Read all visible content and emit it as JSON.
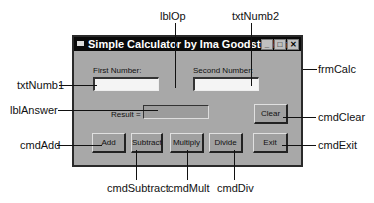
{
  "form": {
    "title": "Simple Calculator by Ima Goodstudent",
    "window_buttons": [
      "_",
      "□",
      "✕"
    ],
    "first_label": "First Number:",
    "second_label": "Second Number:",
    "result_label": "Result =",
    "txtNumb1_value": "",
    "txtNumb2_value": "",
    "buttons": {
      "add": "Add",
      "subtract": "Subtract",
      "multiply": "Multiply",
      "divide": "Divide",
      "clear": "Clear",
      "exit": "Exit"
    }
  },
  "callouts": {
    "lblOp": "lblOp",
    "txtNumb2": "txtNumb2",
    "frmCalc": "frmCalc",
    "txtNumb1": "txtNumb1",
    "lblAnswer": "lblAnswer",
    "cmdClear": "cmdClear",
    "cmdAdd": "cmdAdd",
    "cmdExit": "cmdExit",
    "cmdSubtract": "cmdSubtract",
    "cmdMult": "cmdMult",
    "cmdDiv": "cmdDiv"
  }
}
